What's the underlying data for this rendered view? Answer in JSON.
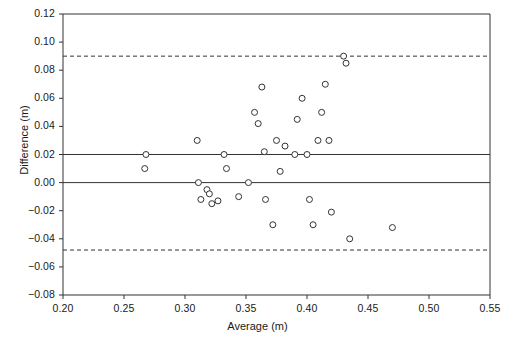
{
  "chart_data": {
    "type": "scatter",
    "title": "",
    "subtitle": "",
    "xlabel": "Average (m)",
    "ylabel": "Difference (m)",
    "xlim": [
      0.2,
      0.55
    ],
    "ylim": [
      -0.08,
      0.12
    ],
    "xticks": [
      "0.20",
      "0.25",
      "0.30",
      "0.35",
      "0.40",
      "0.45",
      "0.50",
      "0.55"
    ],
    "xtick_values": [
      0.2,
      0.25,
      0.3,
      0.35,
      0.4,
      0.45,
      0.5,
      0.55
    ],
    "yticks": [
      "0.12",
      "0.10",
      "0.08",
      "0.06",
      "0.04",
      "0.02",
      "0.00",
      "−0.02",
      "−0.04",
      "−0.06",
      "−0.08"
    ],
    "ytick_values": [
      0.12,
      0.1,
      0.08,
      0.06,
      0.04,
      0.02,
      0.0,
      -0.02,
      -0.04,
      -0.06,
      -0.08
    ],
    "grid": false,
    "legend": null,
    "marker": {
      "shape": "circle-open",
      "edge_color": "#333333",
      "fill_color": "#ffffff",
      "radius_px": 3
    },
    "reference_lines": [
      {
        "name": "mean-difference",
        "y": 0.02,
        "style": "solid",
        "color": "#333333"
      },
      {
        "name": "zero-line",
        "y": 0.0,
        "style": "solid",
        "color": "#333333"
      },
      {
        "name": "upper-limit-of-agreement",
        "y": 0.09,
        "style": "dashed",
        "color": "#333333"
      },
      {
        "name": "lower-limit-of-agreement",
        "y": -0.048,
        "style": "dashed",
        "color": "#333333"
      }
    ],
    "points": [
      {
        "x": 0.267,
        "y": 0.01
      },
      {
        "x": 0.268,
        "y": 0.02
      },
      {
        "x": 0.31,
        "y": 0.03
      },
      {
        "x": 0.311,
        "y": 0.0
      },
      {
        "x": 0.313,
        "y": -0.012
      },
      {
        "x": 0.318,
        "y": -0.005
      },
      {
        "x": 0.32,
        "y": -0.008
      },
      {
        "x": 0.322,
        "y": -0.015
      },
      {
        "x": 0.327,
        "y": -0.013
      },
      {
        "x": 0.332,
        "y": 0.02
      },
      {
        "x": 0.334,
        "y": 0.01
      },
      {
        "x": 0.344,
        "y": -0.01
      },
      {
        "x": 0.352,
        "y": 0.0
      },
      {
        "x": 0.357,
        "y": 0.05
      },
      {
        "x": 0.36,
        "y": 0.042
      },
      {
        "x": 0.363,
        "y": 0.068
      },
      {
        "x": 0.365,
        "y": 0.022
      },
      {
        "x": 0.366,
        "y": -0.012
      },
      {
        "x": 0.372,
        "y": -0.03
      },
      {
        "x": 0.375,
        "y": 0.03
      },
      {
        "x": 0.378,
        "y": 0.008
      },
      {
        "x": 0.382,
        "y": 0.026
      },
      {
        "x": 0.39,
        "y": 0.02
      },
      {
        "x": 0.392,
        "y": 0.045
      },
      {
        "x": 0.396,
        "y": 0.06
      },
      {
        "x": 0.4,
        "y": 0.02
      },
      {
        "x": 0.402,
        "y": -0.012
      },
      {
        "x": 0.405,
        "y": -0.03
      },
      {
        "x": 0.409,
        "y": 0.03
      },
      {
        "x": 0.412,
        "y": 0.05
      },
      {
        "x": 0.415,
        "y": 0.07
      },
      {
        "x": 0.418,
        "y": 0.03
      },
      {
        "x": 0.42,
        "y": -0.021
      },
      {
        "x": 0.43,
        "y": 0.09
      },
      {
        "x": 0.432,
        "y": 0.085
      },
      {
        "x": 0.435,
        "y": -0.04
      },
      {
        "x": 0.47,
        "y": -0.032
      }
    ],
    "n_points": 37
  }
}
